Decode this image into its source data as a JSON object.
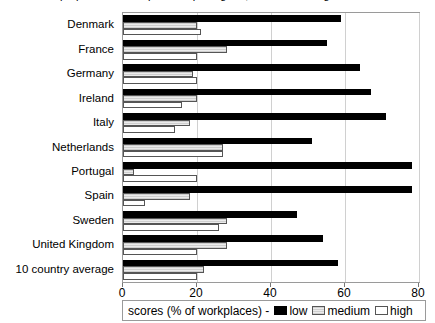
{
  "title_partial": "proportion of workplaces reporting low, medium and high scores",
  "chart_data": {
    "type": "bar",
    "orientation": "horizontal",
    "title": "",
    "xlabel": "scores (% of workplaces)",
    "ylabel": "",
    "xlim": [
      0,
      80
    ],
    "xticks": [
      0,
      20,
      40,
      60,
      80
    ],
    "grid": true,
    "legend_position": "bottom",
    "legend_title": "scores (% of workplaces) -",
    "categories": [
      "Denmark",
      "France",
      "Germany",
      "Ireland",
      "Italy",
      "Netherlands",
      "Portugal",
      "Spain",
      "Sweden",
      "United Kingdom",
      "10 country average"
    ],
    "series": [
      {
        "name": "low",
        "color": "#000000",
        "values": [
          59,
          55,
          64,
          67,
          71,
          51,
          78,
          78,
          47,
          54,
          58
        ]
      },
      {
        "name": "medium",
        "color": "#d9d9d9",
        "values": [
          20,
          28,
          19,
          20,
          18,
          27,
          3,
          18,
          28,
          28,
          22
        ]
      },
      {
        "name": "high",
        "color": "#ffffff",
        "values": [
          21,
          20,
          20,
          16,
          14,
          27,
          20,
          6,
          26,
          20,
          20
        ]
      }
    ]
  },
  "legend": {
    "title": "scores (% of workplaces) -",
    "entries": [
      {
        "label": "low"
      },
      {
        "label": "medium"
      },
      {
        "label": "high"
      }
    ]
  },
  "axis": {
    "x_tick_labels": [
      "0",
      "20",
      "40",
      "60",
      "80"
    ]
  }
}
